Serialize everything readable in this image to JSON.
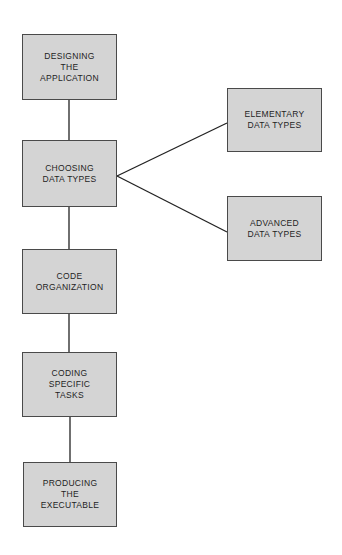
{
  "diagram": {
    "type": "flowchart",
    "colors": {
      "box_fill": "#d4d4d4",
      "box_border": "#4a4a4a",
      "line": "#222222",
      "text": "#1e1e1e"
    },
    "nodes": [
      {
        "id": "designing",
        "label": "DESIGNING\nTHE\nAPPLICATION"
      },
      {
        "id": "choosing",
        "label": "CHOOSING\nDATA TYPES"
      },
      {
        "id": "code_org",
        "label": "CODE\nORGANIZATION"
      },
      {
        "id": "coding",
        "label": "CODING\nSPECIFIC\nTASKS"
      },
      {
        "id": "producing",
        "label": "PRODUCING\nTHE\nEXECUTABLE"
      },
      {
        "id": "elementary",
        "label": "ELEMENTARY\nDATA TYPES"
      },
      {
        "id": "advanced",
        "label": "ADVANCED\nDATA TYPES"
      }
    ],
    "edges": [
      {
        "from": "designing",
        "to": "choosing"
      },
      {
        "from": "choosing",
        "to": "code_org"
      },
      {
        "from": "code_org",
        "to": "coding"
      },
      {
        "from": "coding",
        "to": "producing"
      },
      {
        "from": "choosing",
        "to": "elementary"
      },
      {
        "from": "choosing",
        "to": "advanced"
      }
    ]
  }
}
